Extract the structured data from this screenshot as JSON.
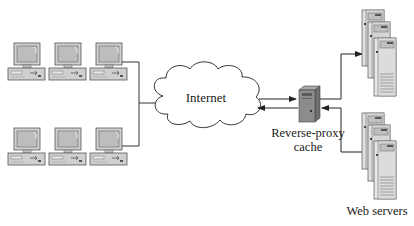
{
  "diagram": {
    "nodes": {
      "clients": {
        "count": 6,
        "rows": 2,
        "per_row": 3,
        "icon": "desktop-computer-icon"
      },
      "internet": {
        "label": "Internet",
        "icon": "cloud-icon"
      },
      "proxy": {
        "label_line1": "Reverse-proxy",
        "label_line2": "cache",
        "icon": "server-tower-icon"
      },
      "web_servers": {
        "label": "Web servers",
        "groups": 2,
        "per_group": 3,
        "icon": "server-rack-icon"
      }
    },
    "edges": [
      {
        "from": "clients",
        "to": "internet",
        "type": "line"
      },
      {
        "from": "internet",
        "to": "proxy",
        "type": "arrow"
      },
      {
        "from": "proxy",
        "to": "internet",
        "type": "arrow"
      },
      {
        "from": "proxy",
        "to": "web_servers_top",
        "type": "arrow"
      },
      {
        "from": "web_servers_bottom",
        "to": "proxy",
        "type": "arrow"
      }
    ],
    "colors": {
      "line": "#333333",
      "device_fill": "#c8c8c8",
      "device_stroke": "#555555",
      "background": "#ffffff"
    }
  }
}
